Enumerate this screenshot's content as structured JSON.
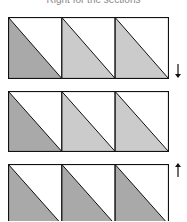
{
  "caption": "Right for the sections",
  "colors": {
    "dark": "#a9a9a9",
    "light": "#cbcbcb",
    "stroke": "#111111",
    "background": "#ffffff"
  },
  "rows": [
    {
      "name": "row-1",
      "top": 17,
      "height": 61,
      "shades": [
        "dark",
        "light",
        "light"
      ],
      "arrow": "down"
    },
    {
      "name": "row-2",
      "top": 91,
      "height": 60,
      "shades": [
        "dark",
        "light",
        "light"
      ],
      "arrow": null
    },
    {
      "name": "row-3",
      "top": 164,
      "height": 60,
      "shades": [
        "dark",
        "dark",
        "dark"
      ],
      "arrow": "up"
    }
  ],
  "arrows": {
    "down": "↓",
    "up": "↑"
  }
}
